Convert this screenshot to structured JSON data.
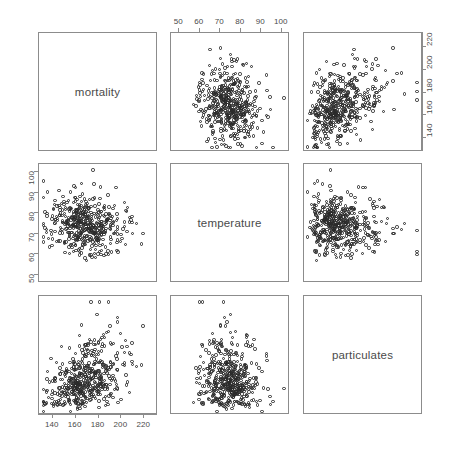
{
  "plot": {
    "type": "scatterplot-matrix",
    "background": "#ffffff",
    "point_color": "#2b2b2b",
    "axis_color": "#8c8c8c",
    "text_color": "#4a4a4a",
    "variables": [
      "mortality",
      "temperature",
      "particulates"
    ],
    "diagonal_labels": {
      "v0": "mortality",
      "v1": "temperature",
      "v2": "particulates"
    }
  },
  "axes": {
    "mortality": {
      "label": "mortality",
      "ticks": [
        140,
        160,
        180,
        200,
        220
      ],
      "tick_labels": [
        "140",
        "160",
        "180",
        "200",
        "220"
      ],
      "range": [
        128,
        232
      ]
    },
    "temperature": {
      "label": "temperature",
      "ticks": [
        50,
        60,
        70,
        80,
        90,
        100
      ],
      "tick_labels": [
        "50",
        "60",
        "70",
        "80",
        "90",
        "100"
      ],
      "range": [
        46,
        104
      ]
    },
    "particulates": {
      "label": "particulates",
      "ticks": [
        20,
        40,
        60,
        80,
        100
      ],
      "tick_labels": [
        "20",
        "40",
        "60",
        "80",
        "100"
      ],
      "range": [
        10,
        110
      ]
    }
  },
  "chart_data": {
    "type": "scatter",
    "title": "",
    "xlabel": "",
    "ylabel": "",
    "grid": false,
    "legend": "none",
    "matrix": {
      "rows": [
        "mortality",
        "temperature",
        "particulates"
      ],
      "cols": [
        "mortality",
        "temperature",
        "particulates"
      ],
      "panels": [
        {
          "row": 0,
          "col": 0,
          "kind": "diagonal",
          "label": "mortality"
        },
        {
          "row": 0,
          "col": 1,
          "kind": "scatter",
          "x": "temperature",
          "y": "mortality",
          "xlim": [
            46,
            104
          ],
          "ylim": [
            128,
            232
          ],
          "x_axis": "top",
          "y_axis": "none",
          "correlation": -0.15,
          "n": 500
        },
        {
          "row": 0,
          "col": 2,
          "kind": "scatter",
          "x": "particulates",
          "y": "mortality",
          "xlim": [
            10,
            110
          ],
          "ylim": [
            128,
            232
          ],
          "x_axis": "none",
          "y_axis": "right",
          "correlation": 0.42,
          "n": 500
        },
        {
          "row": 1,
          "col": 0,
          "kind": "scatter",
          "x": "mortality",
          "y": "temperature",
          "xlim": [
            128,
            232
          ],
          "ylim": [
            46,
            104
          ],
          "x_axis": "none",
          "y_axis": "left",
          "correlation": -0.15,
          "n": 500
        },
        {
          "row": 1,
          "col": 1,
          "kind": "diagonal",
          "label": "temperature"
        },
        {
          "row": 1,
          "col": 2,
          "kind": "scatter",
          "x": "particulates",
          "y": "temperature",
          "xlim": [
            10,
            110
          ],
          "ylim": [
            46,
            104
          ],
          "x_axis": "none",
          "y_axis": "none",
          "correlation": -0.05,
          "n": 500
        },
        {
          "row": 2,
          "col": 0,
          "kind": "scatter",
          "x": "mortality",
          "y": "particulates",
          "xlim": [
            128,
            232
          ],
          "ylim": [
            10,
            110
          ],
          "x_axis": "bottom",
          "y_axis": "none",
          "correlation": 0.42,
          "n": 500
        },
        {
          "row": 2,
          "col": 1,
          "kind": "scatter",
          "x": "temperature",
          "y": "particulates",
          "xlim": [
            46,
            104
          ],
          "ylim": [
            10,
            110
          ],
          "x_axis": "none",
          "y_axis": "none",
          "correlation": -0.05,
          "n": 500
        },
        {
          "row": 2,
          "col": 2,
          "kind": "diagonal",
          "label": "particulates"
        }
      ]
    },
    "variables": {
      "mortality": {
        "mean": 168,
        "sd": 14,
        "min": 132,
        "max": 228,
        "n": 500
      },
      "temperature": {
        "mean": 74,
        "sd": 7,
        "min": 48,
        "max": 101,
        "n": 500
      },
      "particulates": {
        "mean": 41,
        "sd": 16,
        "min": 12,
        "max": 105,
        "n": 500
      }
    },
    "correlations": {
      "mortality_temperature": -0.15,
      "mortality_particulates": 0.42,
      "temperature_particulates": -0.05
    }
  }
}
